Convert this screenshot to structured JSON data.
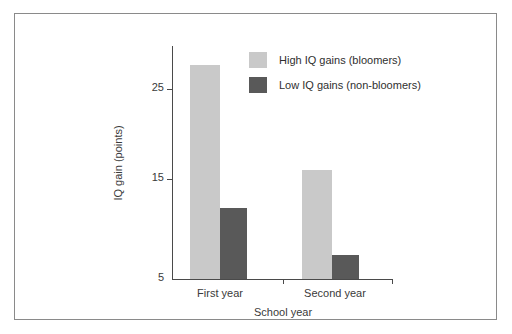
{
  "chart_data": {
    "type": "bar",
    "title": "",
    "xlabel": "School year",
    "ylabel": "IQ gain (points)",
    "categories": [
      "First year",
      "Second year"
    ],
    "series": [
      {
        "name": "High IQ gains (bloomers)",
        "color": "#c9c9c9",
        "values": [
          27.5,
          16.5
        ]
      },
      {
        "name": "Low IQ gains (non-bloomers)",
        "color": "#595959",
        "values": [
          12.5,
          7.5
        ]
      }
    ],
    "ylim": [
      5,
      29.5
    ],
    "yticks": [
      5,
      15,
      25
    ],
    "ytick_labels": [
      "5",
      "15",
      "25"
    ],
    "grid": false,
    "legend_position": "top-right-inside"
  },
  "axes": {
    "y_title": "IQ gain (points)",
    "x_title": "School year",
    "y_tick_labels": [
      "25",
      "15",
      "5"
    ],
    "x_category_labels": [
      "First year",
      "Second year"
    ]
  },
  "legend": {
    "entries": [
      {
        "label": "High IQ gains (bloomers)",
        "swatch": "light-gray-swatch"
      },
      {
        "label": "Low IQ gains (non-bloomers)",
        "swatch": "dark-gray-swatch"
      }
    ]
  },
  "colors": {
    "bar_light": "#c9c9c9",
    "bar_dark": "#595959",
    "axis": "#4a4a4a",
    "frame_border": "#8a8a8a",
    "text": "#3a3a3a",
    "background": "#ffffff"
  }
}
